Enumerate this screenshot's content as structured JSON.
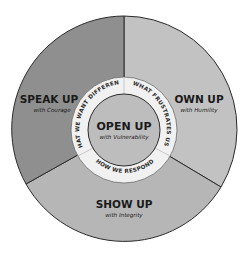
{
  "diagram": {
    "center": {
      "title": "OPEN UP",
      "subtitle": "with Vulnerability"
    },
    "ring": [
      {
        "label": "WHAT FRUSTRATES US"
      },
      {
        "label": "HOW WE RESPOND"
      },
      {
        "label": "WHAT WE WANT DIFFERENT"
      }
    ],
    "segments": [
      {
        "title": "OWN UP",
        "subtitle": "with Humility"
      },
      {
        "title": "SHOW UP",
        "subtitle": "with Integrity"
      },
      {
        "title": "SPEAK UP",
        "subtitle": "with Courage"
      }
    ],
    "colors": {
      "speak_up": "#8f8f8f",
      "own_up": "#c2c2c2",
      "show_up": "#b6b6b6",
      "ring": "#f1f1f1",
      "center": "#bdbdbd",
      "stroke": "#2b2b2b"
    }
  }
}
